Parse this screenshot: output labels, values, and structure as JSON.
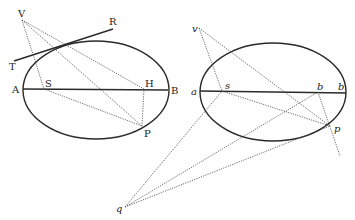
{
  "figure": {
    "left": {
      "labels": {
        "V": "V",
        "R": "R",
        "T": "T",
        "A": "A",
        "S": "S",
        "H": "H",
        "B": "B",
        "P": "P"
      }
    },
    "right": {
      "labels": {
        "v": "v",
        "a": "a",
        "s": "s",
        "h": "b",
        "b": "b",
        "p": "p",
        "q": "q"
      }
    }
  }
}
